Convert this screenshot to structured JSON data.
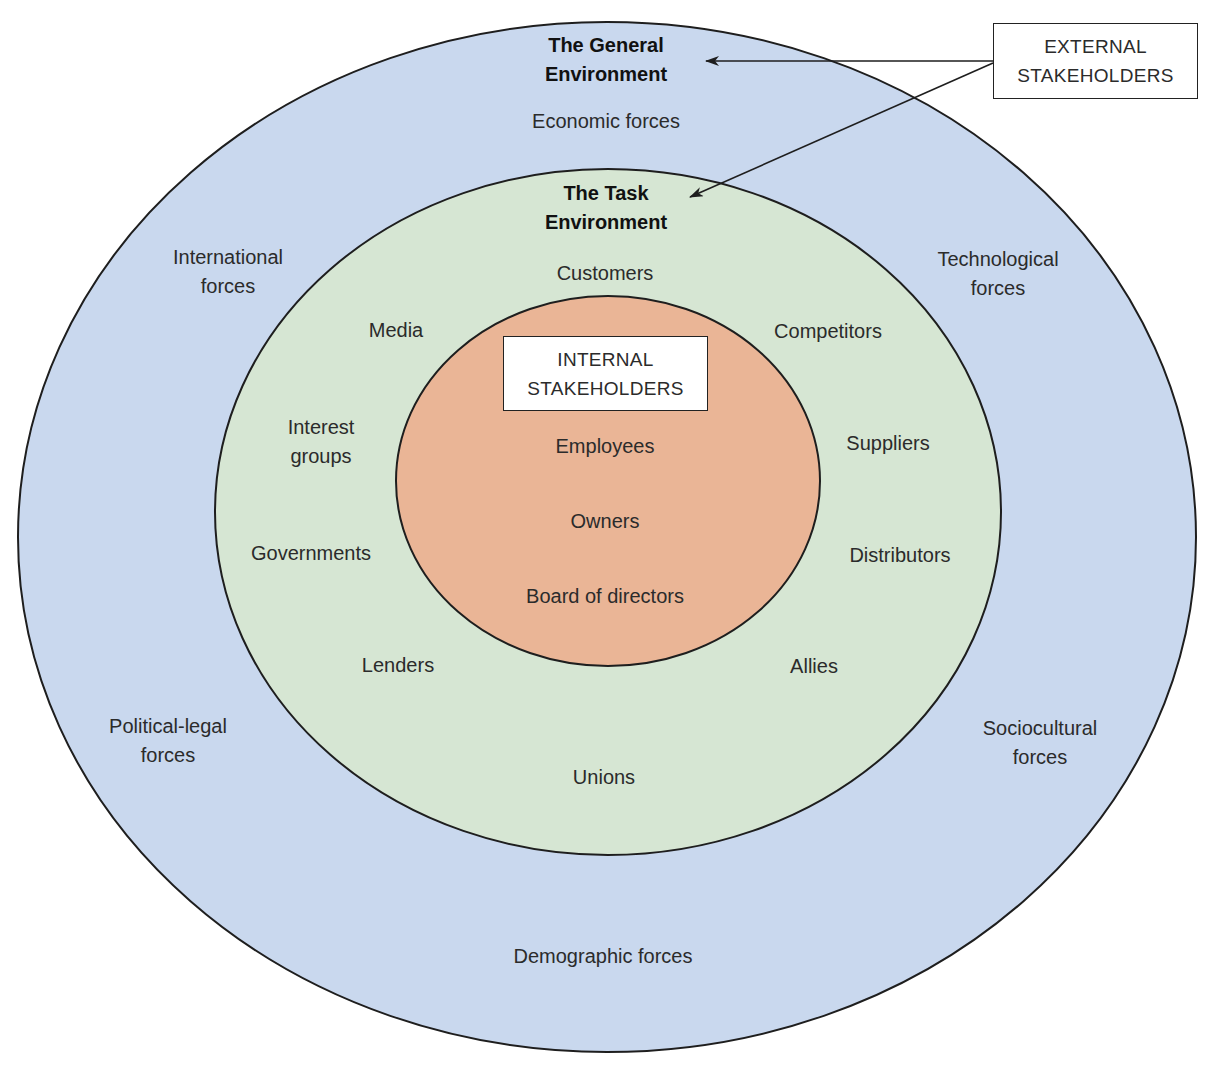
{
  "colors": {
    "general_environment_fill": "#c9d8ee",
    "task_environment_fill": "#d6e6d3",
    "internal_fill": "#eab596",
    "outline": "#1e1e1e",
    "background": "#ffffff"
  },
  "general_environment": {
    "title_line1": "The General",
    "title_line2": "Environment",
    "forces": {
      "economic": "Economic forces",
      "international_line1": "International",
      "international_line2": "forces",
      "technological_line1": "Technological",
      "technological_line2": "forces",
      "political_legal_line1": "Political-legal",
      "political_legal_line2": "forces",
      "sociocultural_line1": "Sociocultural",
      "sociocultural_line2": "forces",
      "demographic": "Demographic forces"
    }
  },
  "task_environment": {
    "title_line1": "The Task",
    "title_line2": "Environment",
    "items": {
      "customers": "Customers",
      "media": "Media",
      "competitors": "Competitors",
      "interest_groups_line1": "Interest",
      "interest_groups_line2": "groups",
      "suppliers": "Suppliers",
      "governments": "Governments",
      "distributors": "Distributors",
      "lenders": "Lenders",
      "allies": "Allies",
      "unions": "Unions"
    }
  },
  "internal": {
    "box_line1": "INTERNAL",
    "box_line2": "STAKEHOLDERS",
    "items": {
      "employees": "Employees",
      "owners": "Owners",
      "board": "Board of directors"
    }
  },
  "external_box": {
    "line1": "EXTERNAL",
    "line2": "STAKEHOLDERS"
  }
}
